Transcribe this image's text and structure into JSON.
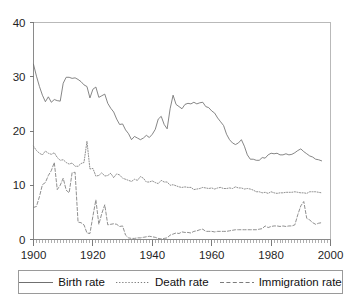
{
  "chart_data": {
    "type": "line",
    "title": "",
    "xlabel": "",
    "ylabel": "",
    "xlim": [
      1900,
      2000
    ],
    "ylim": [
      0,
      40
    ],
    "grid": false,
    "legend_position": "bottom",
    "xticks": [
      1900,
      1920,
      1940,
      1960,
      1980,
      2000
    ],
    "yticks": [
      0,
      10,
      20,
      30,
      40
    ],
    "xtick_labels": [
      "1900",
      "1920",
      "1940",
      "1960",
      "1980",
      "2000"
    ],
    "ytick_labels": [
      "0",
      "10",
      "20",
      "30",
      "40"
    ],
    "x_minor_tick_interval": 1,
    "x": [
      1900,
      1901,
      1902,
      1903,
      1904,
      1905,
      1906,
      1907,
      1908,
      1909,
      1910,
      1911,
      1912,
      1913,
      1914,
      1915,
      1916,
      1917,
      1918,
      1919,
      1920,
      1921,
      1922,
      1923,
      1924,
      1925,
      1926,
      1927,
      1928,
      1929,
      1930,
      1931,
      1932,
      1933,
      1934,
      1935,
      1936,
      1937,
      1938,
      1939,
      1940,
      1941,
      1942,
      1943,
      1944,
      1945,
      1946,
      1947,
      1948,
      1949,
      1950,
      1951,
      1952,
      1953,
      1954,
      1955,
      1956,
      1957,
      1958,
      1959,
      1960,
      1961,
      1962,
      1963,
      1964,
      1965,
      1966,
      1967,
      1968,
      1969,
      1970,
      1971,
      1972,
      1973,
      1974,
      1975,
      1976,
      1977,
      1978,
      1979,
      1980,
      1981,
      1982,
      1983,
      1984,
      1985,
      1986,
      1987,
      1988,
      1989,
      1990,
      1991,
      1992,
      1993,
      1994,
      1995,
      1996,
      1997
    ],
    "series": [
      {
        "name": "Birth rate",
        "style": "solid",
        "values": [
          32.3,
          30.1,
          28.2,
          26.6,
          25.4,
          26.3,
          25.3,
          25.8,
          25.6,
          25.5,
          28.8,
          29.9,
          29.9,
          29.7,
          29.8,
          29.5,
          29.1,
          28.5,
          28.2,
          26.1,
          27.7,
          28.1,
          26.2,
          26.5,
          26.8,
          25.1,
          24.2,
          23.5,
          22.2,
          21.2,
          21.3,
          20.2,
          19.5,
          18.4,
          19.0,
          18.7,
          18.4,
          18.7,
          19.2,
          18.8,
          19.4,
          20.3,
          22.2,
          22.7,
          21.2,
          20.4,
          24.1,
          26.6,
          24.9,
          24.5,
          24.1,
          24.9,
          25.1,
          25.0,
          25.3,
          25.0,
          25.2,
          25.3,
          24.5,
          24.3,
          23.7,
          23.3,
          22.4,
          21.7,
          21.0,
          19.4,
          18.4,
          17.8,
          17.5,
          17.8,
          18.4,
          17.2,
          15.6,
          14.8,
          14.8,
          14.6,
          14.6,
          15.1,
          15.0,
          15.6,
          15.9,
          15.8,
          15.9,
          15.6,
          15.6,
          15.8,
          15.6,
          15.7,
          16.0,
          16.4,
          16.7,
          16.2,
          15.8,
          15.4,
          15.2,
          14.8,
          14.7,
          14.5
        ]
      },
      {
        "name": "Death rate",
        "style": "dotted",
        "values": [
          17.2,
          16.4,
          15.9,
          15.6,
          16.3,
          15.9,
          15.7,
          16.0,
          15.1,
          14.6,
          14.7,
          14.2,
          13.9,
          14.1,
          13.5,
          13.5,
          14.0,
          14.2,
          18.1,
          13.0,
          13.1,
          11.7,
          11.8,
          12.3,
          11.7,
          11.8,
          12.2,
          11.4,
          12.1,
          11.9,
          11.3,
          11.1,
          10.9,
          10.7,
          11.1,
          10.9,
          11.6,
          11.3,
          10.6,
          10.6,
          10.8,
          10.5,
          10.3,
          10.9,
          10.6,
          10.6,
          10.0,
          10.1,
          9.9,
          9.7,
          9.6,
          9.7,
          9.6,
          9.6,
          9.2,
          9.3,
          9.4,
          9.6,
          9.5,
          9.4,
          9.5,
          9.3,
          9.5,
          9.6,
          9.4,
          9.4,
          9.5,
          9.4,
          9.7,
          9.5,
          9.5,
          9.3,
          9.4,
          9.3,
          9.1,
          8.8,
          8.8,
          8.6,
          8.7,
          8.5,
          8.8,
          8.6,
          8.5,
          8.6,
          8.6,
          8.7,
          8.7,
          8.7,
          8.8,
          8.7,
          8.6,
          8.6,
          8.5,
          8.8,
          8.8,
          8.8,
          8.7,
          8.6
        ]
      },
      {
        "name": "Immigration rate",
        "style": "dashed",
        "values": [
          5.9,
          6.1,
          7.9,
          10.1,
          10.5,
          11.8,
          12.7,
          14.2,
          9.2,
          10.0,
          11.3,
          9.1,
          8.6,
          12.3,
          12.4,
          3.2,
          3.1,
          2.7,
          1.2,
          1.1,
          4.3,
          7.3,
          2.8,
          4.8,
          6.4,
          2.7,
          2.8,
          2.9,
          2.8,
          2.4,
          2.5,
          0.8,
          0.3,
          0.2,
          0.2,
          0.3,
          0.3,
          0.4,
          0.5,
          0.6,
          0.5,
          0.4,
          0.2,
          0.1,
          0.2,
          0.3,
          0.8,
          1.0,
          1.2,
          1.1,
          1.4,
          1.3,
          1.3,
          1.2,
          1.5,
          1.6,
          1.8,
          1.9,
          1.5,
          1.5,
          1.5,
          1.4,
          1.5,
          1.5,
          1.5,
          1.5,
          1.6,
          1.7,
          1.8,
          1.8,
          1.8,
          1.8,
          1.8,
          1.8,
          1.8,
          1.8,
          1.9,
          2.0,
          2.5,
          2.2,
          2.4,
          2.5,
          2.5,
          2.4,
          2.5,
          2.4,
          2.5,
          2.5,
          2.7,
          4.6,
          6.2,
          7.0,
          3.9,
          3.6,
          3.1,
          2.8,
          3.0,
          3.1
        ]
      }
    ]
  },
  "legend": {
    "entries": [
      {
        "label": "Birth rate",
        "style": "solid"
      },
      {
        "label": "Death rate",
        "style": "dotted"
      },
      {
        "label": "Immigration rate",
        "style": "dashed"
      }
    ]
  }
}
